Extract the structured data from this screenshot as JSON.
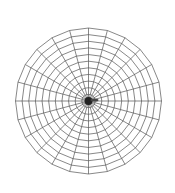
{
  "diagram": {
    "type": "polar-mesh",
    "center": [
      88.5,
      101
    ],
    "radius": 73,
    "spoke_count": 24,
    "ring_count": 11,
    "ring_shape": "polygon",
    "stroke_color": "#555555",
    "hub_color": "#222222",
    "background": "#ffffff"
  }
}
